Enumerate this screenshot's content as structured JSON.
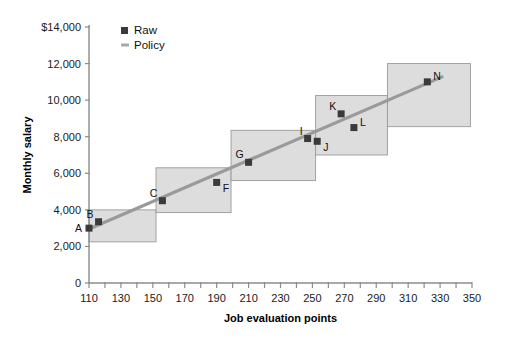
{
  "chart_data": {
    "type": "scatter",
    "title": "",
    "xlabel": "Job evaluation points",
    "ylabel": "Monthly salary",
    "xlim": [
      110,
      350
    ],
    "ylim": [
      0,
      14000
    ],
    "grid": false,
    "legend_position": "top-left",
    "x_tick_labels": [
      "110",
      "130",
      "150",
      "170",
      "190",
      "210",
      "230",
      "250",
      "270",
      "290",
      "310",
      "330",
      "350"
    ],
    "x_tick_values": [
      110,
      130,
      150,
      170,
      190,
      210,
      230,
      250,
      270,
      290,
      310,
      330,
      350
    ],
    "x_minor_tick_values": [
      120,
      140,
      160,
      180,
      200,
      220,
      240,
      260,
      280,
      300,
      320,
      340
    ],
    "y_tick_labels": [
      "0",
      "2,000",
      "4,000",
      "6,000",
      "8,000",
      "10,000",
      "12,000",
      "$14,000"
    ],
    "y_tick_values": [
      0,
      2000,
      4000,
      6000,
      8000,
      10000,
      12000,
      14000
    ],
    "legend": [
      {
        "name": "Raw",
        "marker": "square",
        "color": "#3a3a3a"
      },
      {
        "name": "Policy",
        "marker": "line",
        "color": "#a8a8a8"
      }
    ],
    "series": [
      {
        "name": "Raw",
        "type": "scatter",
        "color": "#3a3a3a",
        "points": [
          {
            "label": "A",
            "x": 110,
            "y": 3000,
            "label_pos": "left"
          },
          {
            "label": "B",
            "x": 116,
            "y": 3350,
            "label_pos": "upper-left"
          },
          {
            "label": "C",
            "x": 156,
            "y": 4500,
            "label_pos": "upper-left"
          },
          {
            "label": "F",
            "x": 190,
            "y": 5500,
            "label_pos": "lower-right"
          },
          {
            "label": "G",
            "x": 210,
            "y": 6600,
            "label_pos": "upper-left"
          },
          {
            "label": "I",
            "x": 247,
            "y": 7900,
            "label_pos": "upper-left"
          },
          {
            "label": "J",
            "x": 253,
            "y": 7750,
            "label_pos": "lower-right"
          },
          {
            "label": "K",
            "x": 268,
            "y": 9250,
            "label_pos": "upper-left"
          },
          {
            "label": "L",
            "x": 276,
            "y": 8500,
            "label_pos": "upper-right"
          },
          {
            "label": "N",
            "x": 322,
            "y": 11000,
            "label_pos": "upper-right"
          }
        ]
      },
      {
        "name": "Policy",
        "type": "line",
        "color": "#a8a8a8",
        "x": [
          110,
          332
        ],
        "y": [
          2950,
          11300
        ]
      }
    ],
    "grade_boxes": [
      {
        "x0": 110,
        "x1": 152,
        "y0": 2250,
        "y1": 4000
      },
      {
        "x0": 152,
        "x1": 199,
        "y0": 3850,
        "y1": 6300
      },
      {
        "x0": 199,
        "x1": 252,
        "y0": 5600,
        "y1": 8350
      },
      {
        "x0": 252,
        "x1": 297,
        "y0": 7000,
        "y1": 10250
      },
      {
        "x0": 297,
        "x1": 349,
        "y0": 8550,
        "y1": 12000
      }
    ]
  }
}
